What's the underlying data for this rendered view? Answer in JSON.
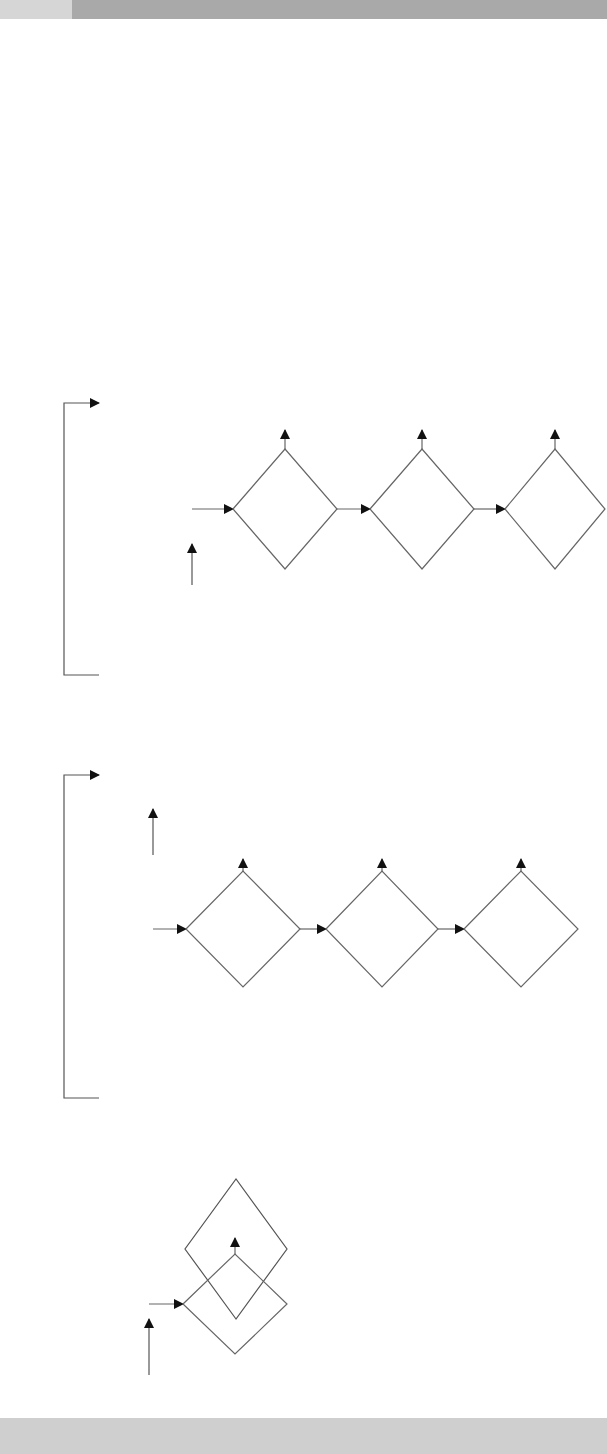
{
  "page": {
    "header_band_color": "#a9a9a9",
    "footer_band_color": "#cfcfcf",
    "orientation": "rotated-90-ccw"
  },
  "diagram": {
    "stages": [
      {
        "id": "stage1",
        "label": "DETERMINE NEED FOR CONVENTIONAL INTERVENTION",
        "conditions": [
          {
            "label": "Failure of all natural interventions",
            "action": "Di-sodium cromoglycate"
          }
        ]
      },
      {
        "id": "stage2",
        "label": "MINIMIZE OBSTACLES TO HEALING",
        "conditions": [
          {
            "label": "Environmental allergens",
            "action": "Minimize exposure"
          },
          {
            "label": "Food allergies",
            "action": "Elimination diet and challenge testing  or other tests to identify food allergens"
          },
          {
            "label": "Stress",
            "action": "Stress management"
          }
        ]
      },
      {
        "id": "stage3",
        "label": "TAILOR NATURAL INTERVENTIONS TO PATIENT NEEDS",
        "conditions": [
          {
            "label": "Indication of nutrient deficiencies",
            "action": "Whole foods hypoallergenic, gluten-free diet low in animal products and high in complex carbohydrates",
            "action_extra": "High-potency vitamin-mineral"
          },
          {
            "label": "Indications of RAS and general hypersensitivity",
            "action": "Quercetin",
            "action_extra": "Vitamin C"
          },
          {
            "label": "Identifiable aphthous ulcers",
            "action": "DGL tablets dissolved in mouth in contact with lesion"
          }
        ]
      }
    ]
  }
}
